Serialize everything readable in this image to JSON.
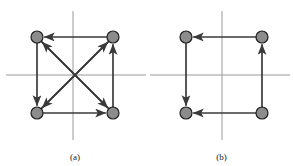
{
  "figure": {
    "background_color": "#ffffff",
    "axis_color": "#9a9a9a",
    "edge_color": "#3a3a3a",
    "node_fill": "#8c8c8c",
    "node_stroke": "#1f1f1f",
    "node_radius": 6,
    "panels": [
      {
        "id": "a",
        "caption": "(a)",
        "nodes": [
          {
            "name": "top-left",
            "x": 37,
            "y": 37
          },
          {
            "name": "top-right",
            "x": 113,
            "y": 37
          },
          {
            "name": "bottom-left",
            "x": 37,
            "y": 113
          },
          {
            "name": "bottom-right",
            "x": 113,
            "y": 113
          }
        ],
        "axes": {
          "horizontal": {
            "x1": 6,
            "y1": 75,
            "x2": 146,
            "y2": 75
          },
          "vertical": {
            "x1": 73,
            "y1": 11,
            "x2": 73,
            "y2": 140
          }
        },
        "edges": [
          {
            "name": "top-edge",
            "from": "top-right",
            "to": "top-left"
          },
          {
            "name": "left-edge",
            "from": "top-left",
            "to": "bottom-left"
          },
          {
            "name": "bottom-edge",
            "from": "bottom-left",
            "to": "bottom-right"
          },
          {
            "name": "right-edge",
            "from": "bottom-right",
            "to": "top-right"
          },
          {
            "name": "diagonal-tl-br",
            "from": "top-left",
            "to": "bottom-right"
          },
          {
            "name": "diagonal-br-tl",
            "from": "bottom-right",
            "to": "top-left"
          },
          {
            "name": "diagonal-bl-tr",
            "from": "bottom-left",
            "to": "top-right"
          },
          {
            "name": "diagonal-tr-bl",
            "from": "top-right",
            "to": "bottom-left"
          }
        ]
      },
      {
        "id": "b",
        "caption": "(b)",
        "nodes": [
          {
            "name": "top-left",
            "x": 36,
            "y": 37
          },
          {
            "name": "top-right",
            "x": 112,
            "y": 37
          },
          {
            "name": "bottom-left",
            "x": 36,
            "y": 113
          },
          {
            "name": "bottom-right",
            "x": 112,
            "y": 113
          }
        ],
        "axes": {
          "horizontal": {
            "x1": 0,
            "y1": 75,
            "x2": 140,
            "y2": 75
          },
          "vertical": {
            "x1": 72,
            "y1": 11,
            "x2": 72,
            "y2": 140
          }
        },
        "edges": [
          {
            "name": "top-edge",
            "from": "top-right",
            "to": "top-left"
          },
          {
            "name": "left-edge",
            "from": "top-left",
            "to": "bottom-left"
          },
          {
            "name": "bottom-edge",
            "from": "bottom-right",
            "to": "bottom-left"
          },
          {
            "name": "right-edge",
            "from": "bottom-right",
            "to": "top-right"
          }
        ]
      }
    ]
  }
}
